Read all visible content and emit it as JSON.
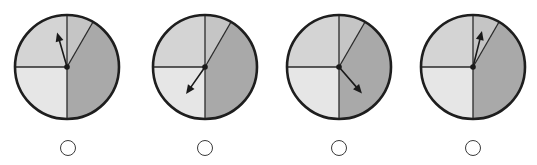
{
  "colors": {
    "outline": "#1e1e1e",
    "divider": "#2a2a2a",
    "arrow": "#1a1a1a",
    "sector_top_small": "#c5c5c5",
    "sector_right_large": "#a9a9a9",
    "sector_bottom_left": "#e6e6e6",
    "sector_top_left": "#d4d4d4",
    "radio_border": "#3a3a3a"
  },
  "spinner_layout": {
    "radius": 52,
    "center_y": 67,
    "sectors": [
      {
        "name": "top-small",
        "start_deg": 0,
        "end_deg": 30,
        "color_key": "sector_top_small"
      },
      {
        "name": "right-large",
        "start_deg": 30,
        "end_deg": 180,
        "color_key": "sector_right_large"
      },
      {
        "name": "bottom-left",
        "start_deg": 180,
        "end_deg": 270,
        "color_key": "sector_bottom_left"
      },
      {
        "name": "top-left",
        "start_deg": 270,
        "end_deg": 360,
        "color_key": "sector_top_left"
      }
    ]
  },
  "spinners": [
    {
      "id": "spinner-1",
      "center_x": 67,
      "arrow_angle_deg": 344,
      "arrow_length": 36,
      "radio": {
        "cx": 68,
        "cy": 148,
        "selected": false
      }
    },
    {
      "id": "spinner-2",
      "center_x": 205,
      "arrow_angle_deg": 215,
      "arrow_length": 33,
      "radio": {
        "cx": 205,
        "cy": 148,
        "selected": false
      }
    },
    {
      "id": "spinner-3",
      "center_x": 339,
      "arrow_angle_deg": 139,
      "arrow_length": 35,
      "radio": {
        "cx": 339,
        "cy": 148,
        "selected": false
      }
    },
    {
      "id": "spinner-4",
      "center_x": 473,
      "arrow_angle_deg": 14,
      "arrow_length": 37,
      "radio": {
        "cx": 473,
        "cy": 148,
        "selected": false
      }
    }
  ]
}
